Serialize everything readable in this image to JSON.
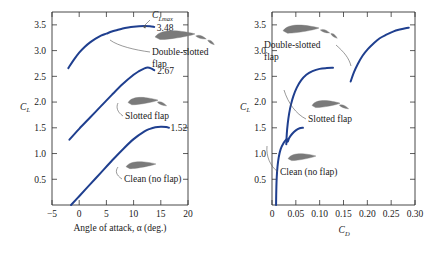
{
  "figure": {
    "background": "#ffffff",
    "curve_color": "#1f3f8f",
    "airfoil_color": "#7a7a7a",
    "leader_color": "#555555",
    "axis_color": "#333333"
  },
  "chart_data": [
    {
      "type": "line",
      "panel": "left",
      "title": "",
      "xlabel": "Angle of attack, α (deg.)",
      "ylabel": "C_L",
      "ylabel_main": "C",
      "ylabel_sub": "L",
      "xlim": [
        -5,
        20
      ],
      "ylim": [
        0,
        3.75
      ],
      "xticks": [
        -5,
        0,
        5,
        10,
        15,
        20
      ],
      "xtick_labels": [
        "−5",
        "0",
        "5",
        "10",
        "15",
        "20"
      ],
      "yticks": [
        0.5,
        1.0,
        1.5,
        2.0,
        2.5,
        3.0,
        3.5
      ],
      "ytick_labels": [
        "0.5",
        "1.0",
        "1.5",
        "2.0",
        "2.5",
        "3.0",
        "3.5"
      ],
      "grid": false,
      "legend": "none",
      "series": [
        {
          "name": "Double-slotted flap",
          "clmax": 3.48,
          "clmax_label": "3.48",
          "points": [
            [
              -2.0,
              2.66
            ],
            [
              -1.0,
              2.82
            ],
            [
              0.0,
              2.96
            ],
            [
              1.0,
              3.07
            ],
            [
              2.0,
              3.16
            ],
            [
              3.0,
              3.23
            ],
            [
              4.0,
              3.29
            ],
            [
              5.0,
              3.33
            ],
            [
              6.0,
              3.37
            ],
            [
              7.0,
              3.4
            ],
            [
              8.0,
              3.43
            ],
            [
              9.0,
              3.45
            ],
            [
              10.0,
              3.465
            ],
            [
              11.0,
              3.475
            ],
            [
              12.0,
              3.48
            ],
            [
              13.0,
              3.475
            ],
            [
              13.8,
              3.46
            ]
          ]
        },
        {
          "name": "Slotted flap",
          "clmax": 2.67,
          "clmax_label": "2.67",
          "points": [
            [
              -1.8,
              1.27
            ],
            [
              0.0,
              1.48
            ],
            [
              2.0,
              1.7
            ],
            [
              4.0,
              1.92
            ],
            [
              6.0,
              2.14
            ],
            [
              8.0,
              2.35
            ],
            [
              10.0,
              2.53
            ],
            [
              11.0,
              2.6
            ],
            [
              12.0,
              2.655
            ],
            [
              12.6,
              2.67
            ],
            [
              13.2,
              2.655
            ],
            [
              13.8,
              2.62
            ]
          ]
        },
        {
          "name": "Clean (no flap)",
          "clmax": 1.52,
          "clmax_label": "1.52",
          "points": [
            [
              -1.5,
              0.0
            ],
            [
              0.0,
              0.17
            ],
            [
              2.0,
              0.4
            ],
            [
              4.0,
              0.63
            ],
            [
              6.0,
              0.86
            ],
            [
              8.0,
              1.08
            ],
            [
              10.0,
              1.28
            ],
            [
              12.0,
              1.43
            ],
            [
              13.0,
              1.48
            ],
            [
              14.0,
              1.51
            ],
            [
              15.0,
              1.52
            ],
            [
              16.0,
              1.515
            ],
            [
              16.5,
              1.5
            ]
          ]
        }
      ],
      "annotations": [
        {
          "name": "clmax-annotation",
          "text": "C_Lmax",
          "main": "C",
          "sub": "Lmax"
        },
        {
          "name": "double-slotted-label",
          "line1": "Double-slotted",
          "line2": "flap"
        },
        {
          "name": "slotted-label",
          "text": "Slotted flap"
        },
        {
          "name": "clean-label",
          "text": "Clean (no flap)"
        }
      ]
    },
    {
      "type": "line",
      "panel": "right",
      "title": "",
      "xlabel": "C_D",
      "xlabel_main": "C",
      "xlabel_sub": "D",
      "ylabel": "C_L",
      "ylabel_main": "C",
      "ylabel_sub": "L",
      "xlim": [
        0,
        0.3
      ],
      "ylim": [
        0,
        3.75
      ],
      "xticks": [
        0,
        0.05,
        0.1,
        0.15,
        0.2,
        0.25,
        0.3
      ],
      "xtick_labels": [
        "0",
        "0.05",
        "0.10",
        "0.15",
        "0.20",
        "0.25",
        "0.30"
      ],
      "yticks": [
        0.5,
        1.0,
        1.5,
        2.0,
        2.5,
        3.0,
        3.5
      ],
      "ytick_labels": [
        "0.5",
        "1.0",
        "1.5",
        "2.0",
        "2.5",
        "3.0",
        "3.5"
      ],
      "grid": false,
      "legend": "none",
      "series": [
        {
          "name": "Clean (no flap)",
          "points": [
            [
              0.0085,
              0.0
            ],
            [
              0.0088,
              0.18
            ],
            [
              0.0092,
              0.36
            ],
            [
              0.01,
              0.55
            ],
            [
              0.0115,
              0.74
            ],
            [
              0.014,
              0.92
            ],
            [
              0.018,
              1.08
            ],
            [
              0.024,
              1.2
            ],
            [
              0.031,
              1.28
            ],
            [
              0.033,
              1.23
            ],
            [
              0.036,
              1.3
            ],
            [
              0.042,
              1.38
            ],
            [
              0.05,
              1.45
            ],
            [
              0.058,
              1.49
            ],
            [
              0.065,
              1.5
            ]
          ]
        },
        {
          "name": "Slotted flap",
          "points": [
            [
              0.03,
              1.18
            ],
            [
              0.031,
              1.38
            ],
            [
              0.033,
              1.58
            ],
            [
              0.036,
              1.78
            ],
            [
              0.04,
              1.96
            ],
            [
              0.045,
              2.12
            ],
            [
              0.052,
              2.28
            ],
            [
              0.061,
              2.42
            ],
            [
              0.072,
              2.53
            ],
            [
              0.085,
              2.6
            ],
            [
              0.1,
              2.645
            ],
            [
              0.115,
              2.66
            ],
            [
              0.128,
              2.665
            ]
          ]
        },
        {
          "name": "Double-slotted flap",
          "points": [
            [
              0.165,
              2.4
            ],
            [
              0.172,
              2.58
            ],
            [
              0.18,
              2.74
            ],
            [
              0.19,
              2.9
            ],
            [
              0.201,
              3.03
            ],
            [
              0.213,
              3.14
            ],
            [
              0.226,
              3.24
            ],
            [
              0.24,
              3.31
            ],
            [
              0.254,
              3.37
            ],
            [
              0.268,
              3.41
            ],
            [
              0.28,
              3.435
            ],
            [
              0.287,
              3.445
            ]
          ]
        }
      ],
      "annotations": [
        {
          "name": "double-slotted-label",
          "line1": "Double-slotted",
          "line2": "flap"
        },
        {
          "name": "slotted-label",
          "text": "Slotted flap"
        },
        {
          "name": "clean-label",
          "text": "Clean (no flap)"
        }
      ]
    }
  ]
}
